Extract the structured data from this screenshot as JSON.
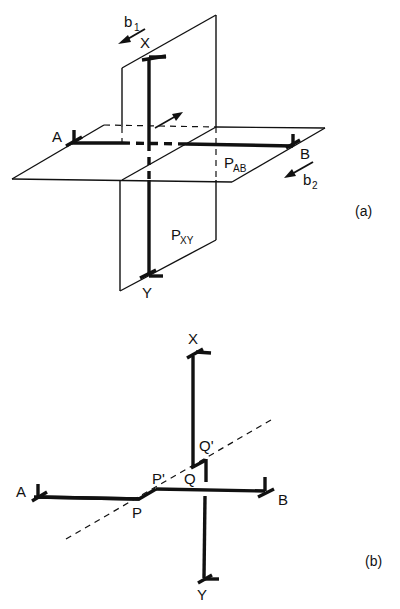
{
  "figure_a": {
    "caption": "(a)",
    "labels": {
      "x": "X",
      "y": "Y",
      "a": "A",
      "b": "B",
      "b1": "b",
      "b1_sub": "1",
      "b2": "b",
      "b2_sub": "2",
      "pab": "P",
      "pab_sub": "AB",
      "pxy": "P",
      "pxy_sub": "XY"
    }
  },
  "figure_b": {
    "caption": "(b)",
    "labels": {
      "x": "X",
      "y": "Y",
      "a": "A",
      "b": "B",
      "p": "P",
      "p_prime": "P'",
      "q": "Q",
      "q_prime": "Q'"
    }
  }
}
